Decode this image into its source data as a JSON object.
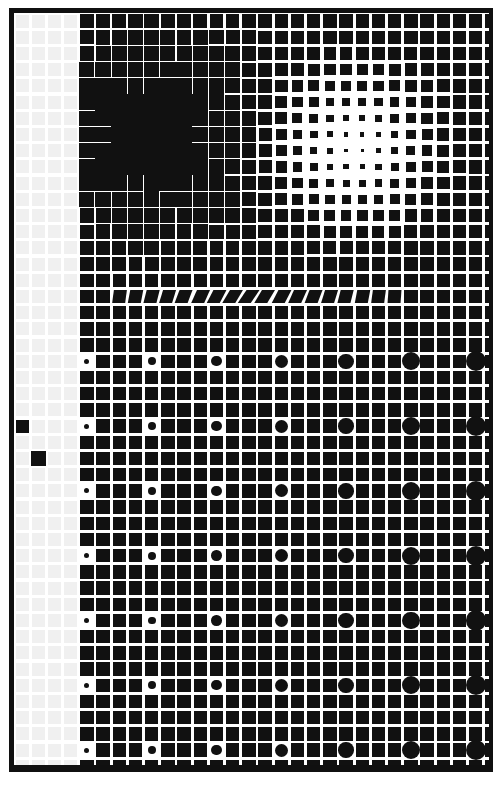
{
  "document": {
    "title": "Halftone Screen Test Pattern",
    "type": "halftone-dither-test-chart",
    "width": 502,
    "height": 794,
    "background_color": "#ffffff",
    "ink_color": "#111111",
    "faint_cell_color": "#f0f0f0"
  },
  "frame": {
    "name": "outer-border",
    "top": 8,
    "left": 9,
    "right": 493,
    "bottom": 772,
    "thickness_left": 5,
    "thickness_top": 5,
    "thickness_right": 4,
    "thickness_bottom": 7,
    "color": "#101010"
  },
  "grid": {
    "origin_x": 14,
    "origin_y": 13,
    "pitch_x": 16.2,
    "pitch_y": 16.2,
    "columns": 30,
    "rows": 47,
    "cell_gap_ratio": 0.17
  },
  "regions": {
    "left_margin": {
      "name": "near-white-left-margin",
      "description": "Very light column band with barely visible grid cells",
      "col_start": 0,
      "col_end": 3,
      "cell_color": "#f0f0f0",
      "stray_marks": [
        {
          "col": 5,
          "row": 0,
          "size": 14
        },
        {
          "col": 0,
          "row": 25,
          "size": 13
        },
        {
          "col": 1,
          "row": 27,
          "size": 15
        }
      ]
    },
    "dark_cluster": {
      "name": "upper-left-dark-blob",
      "description": "Dense region where marks grow until adjacent cells merge into solid black",
      "center_col": 8,
      "center_row": 7,
      "radius_cols": 6.5,
      "peak_fill": 1.04
    },
    "bright_spot": {
      "name": "upper-right-radial-highlight",
      "description": "Radial falloff to a near-white center; smallest dot at the core",
      "center_x": 355,
      "center_y": 147,
      "radius": 118,
      "min_fill": 0.14
    },
    "skew_band": {
      "name": "parallelogram-skew-band",
      "description": "One row of cells sheared into leaning parallelograms, peaking mid-plate",
      "row": 17,
      "col_start": 6,
      "col_end": 23,
      "peak_col": 14,
      "max_skew_deg": 34
    },
    "circle_lattice": {
      "name": "circle-overlay-lattice",
      "description": "Round marks replace squares on every 4th row and column; diameter grows toward the right",
      "row_step": 4,
      "col_step": 4,
      "row_start": 21,
      "col_start": 4,
      "min_diameter": 5,
      "max_diameter": 21
    }
  },
  "chart_data": {
    "type": "heatmap",
    "xlabel": "",
    "ylabel": "",
    "grid": true,
    "legend": "none",
    "colorbar": false,
    "fill_scale": [
      0,
      1
    ],
    "column_profile_at_row_30": [
      0.04,
      0.05,
      0.06,
      0.08,
      0.62,
      0.66,
      0.68,
      0.7,
      0.71,
      0.72,
      0.72,
      0.73,
      0.73,
      0.74,
      0.74,
      0.74,
      0.75,
      0.75,
      0.75,
      0.76,
      0.76,
      0.76,
      0.77,
      0.77,
      0.77,
      0.78,
      0.78,
      0.78,
      0.79,
      0.79
    ],
    "row_profile_at_col_12": [
      0.1,
      0.32,
      0.7,
      0.78,
      0.88,
      0.96,
      1.0,
      1.02,
      1.0,
      0.94,
      0.86,
      0.8,
      0.76,
      0.74,
      0.73,
      0.72,
      0.72,
      0.72,
      0.72,
      0.72,
      0.72,
      0.72,
      0.72,
      0.72,
      0.72,
      0.72,
      0.72,
      0.72,
      0.72,
      0.72,
      0.72,
      0.72,
      0.72,
      0.72,
      0.72,
      0.72,
      0.72,
      0.72,
      0.72,
      0.72,
      0.72,
      0.72,
      0.72,
      0.72,
      0.72,
      0.72,
      0.7
    ]
  }
}
